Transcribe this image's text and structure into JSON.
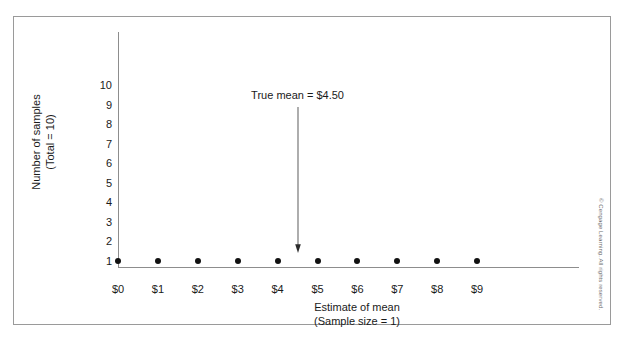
{
  "chart_data": {
    "type": "scatter",
    "title": "",
    "xlabel": "Estimate of mean",
    "xlabel_line2": "(Sample size = 1)",
    "ylabel": "Number of samples",
    "ylabel_line2": "(Total = 10)",
    "x_tick_labels": [
      "$0",
      "$1",
      "$2",
      "$3",
      "$4",
      "$5",
      "$6",
      "$7",
      "$8",
      "$9"
    ],
    "y_tick_labels": [
      "10",
      "9",
      "8",
      "7",
      "6",
      "5",
      "4",
      "3",
      "2",
      "1"
    ],
    "xlim": [
      0,
      9
    ],
    "ylim": [
      0,
      10
    ],
    "grid": false,
    "legend": null,
    "x": [
      0,
      1,
      2,
      3,
      4,
      5,
      6,
      7,
      8,
      9
    ],
    "values": [
      1,
      1,
      1,
      1,
      1,
      1,
      1,
      1,
      1,
      1
    ],
    "series": [
      {
        "name": "Sample means",
        "x": [
          0,
          1,
          2,
          3,
          4,
          5,
          6,
          7,
          8,
          9
        ],
        "values": [
          1,
          1,
          1,
          1,
          1,
          1,
          1,
          1,
          1,
          1
        ]
      }
    ],
    "annotations": [
      {
        "text": "True mean  =  $4.50",
        "x": 4.5,
        "y": 9,
        "marker": "down-arrow"
      }
    ],
    "point_color": "#111111",
    "axis_color": "#8d8d8d"
  },
  "credit": {
    "text": "© Cengage Learning. All rights reserved."
  }
}
